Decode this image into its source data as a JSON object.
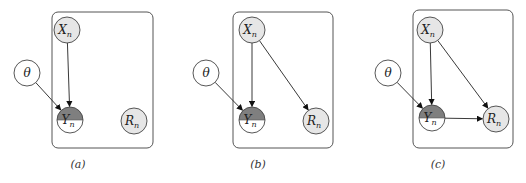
{
  "figure": {
    "colors": {
      "observed_fill": "#e6e6e6",
      "latent_fill": "#ffffff",
      "partial_fill": "#7f7f7f",
      "stroke": "#444444"
    },
    "panels": [
      {
        "id": "a",
        "caption": "(a)",
        "plate": {
          "x": 52,
          "y": 12,
          "w": 101,
          "h": 136
        },
        "nodes": {
          "theta": {
            "label": "θ",
            "cx": 27,
            "cy": 73
          },
          "X": {
            "label": "X",
            "sub": "n",
            "cx": 67,
            "cy": 30
          },
          "Y": {
            "label": "Y",
            "sub": "n",
            "cx": 70,
            "cy": 120
          },
          "R": {
            "label": "R",
            "sub": "n",
            "cx": 134,
            "cy": 121
          }
        },
        "edges": [
          "X->Y",
          "theta->Y"
        ],
        "caption_pos": {
          "x": 78,
          "y": 168
        }
      },
      {
        "id": "b",
        "caption": "(b)",
        "plate": {
          "x": 233,
          "y": 12,
          "w": 100,
          "h": 136
        },
        "nodes": {
          "theta": {
            "label": "θ",
            "cx": 206,
            "cy": 73
          },
          "X": {
            "label": "X",
            "sub": "n",
            "cx": 252,
            "cy": 30
          },
          "Y": {
            "label": "Y",
            "sub": "n",
            "cx": 252,
            "cy": 120
          },
          "R": {
            "label": "R",
            "sub": "n",
            "cx": 316,
            "cy": 121
          }
        },
        "edges": [
          "X->Y",
          "theta->Y",
          "X->R"
        ],
        "caption_pos": {
          "x": 258,
          "y": 168
        }
      },
      {
        "id": "c",
        "caption": "(c)",
        "plate": {
          "x": 413,
          "y": 10,
          "w": 100,
          "h": 138
        },
        "nodes": {
          "theta": {
            "label": "θ",
            "cx": 388,
            "cy": 73
          },
          "X": {
            "label": "X",
            "sub": "n",
            "cx": 430,
            "cy": 30
          },
          "Y": {
            "label": "Y",
            "sub": "n",
            "cx": 432,
            "cy": 118
          },
          "R": {
            "label": "R",
            "sub": "n",
            "cx": 496,
            "cy": 119
          }
        },
        "edges": [
          "X->Y",
          "theta->Y",
          "X->R",
          "Y->R"
        ],
        "caption_pos": {
          "x": 438,
          "y": 168
        }
      }
    ]
  }
}
